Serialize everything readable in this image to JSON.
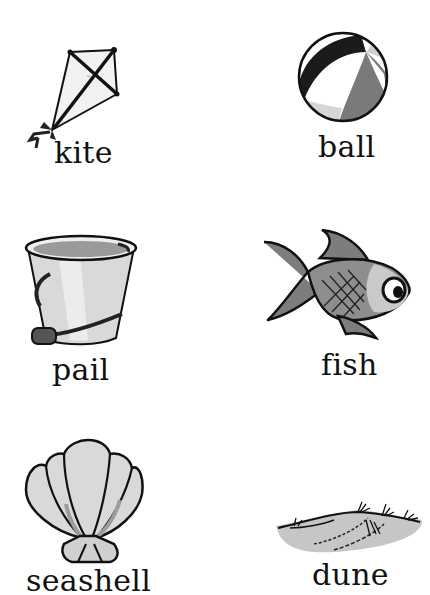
{
  "worksheet": {
    "items": [
      {
        "word": "kite",
        "picture": "kite-picture"
      },
      {
        "word": "ball",
        "picture": "beach-ball-picture"
      },
      {
        "word": "pail",
        "picture": "pail-picture"
      },
      {
        "word": "fish",
        "picture": "fish-picture"
      },
      {
        "word": "seashell",
        "picture": "seashell-picture"
      },
      {
        "word": "dune",
        "picture": "dune-picture"
      }
    ]
  },
  "colors": {
    "background": "#ffffff",
    "ink": "#111111",
    "light_gray": "#d8d8d8",
    "mid_gray": "#8a8a8a",
    "dark_gray": "#3a3a3a"
  }
}
